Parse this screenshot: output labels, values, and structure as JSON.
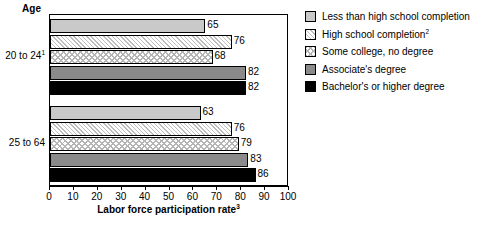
{
  "header": {
    "age_label": "Age"
  },
  "axis": {
    "x_title": "Labor force participation rate",
    "x_title_superscript": "3",
    "ticks": [
      "0",
      "10",
      "20",
      "30",
      "40",
      "50",
      "60",
      "70",
      "80",
      "90",
      "100"
    ]
  },
  "groups": [
    {
      "label": "20 to 24",
      "superscript": "1",
      "values": [
        "65",
        "76",
        "68",
        "82",
        "82"
      ]
    },
    {
      "label": "25 to 64",
      "superscript": "",
      "values": [
        "63",
        "76",
        "79",
        "83",
        "86"
      ]
    }
  ],
  "legend": {
    "items": [
      {
        "label": "Less than high school completion",
        "superscript": "",
        "swatch": "light-gray-swatch"
      },
      {
        "label": "High school completion",
        "superscript": "2",
        "swatch": "diagonal-hatch-swatch"
      },
      {
        "label": "Some college, no degree",
        "superscript": "",
        "swatch": "checker-swatch"
      },
      {
        "label": "Associate's degree",
        "superscript": "",
        "swatch": "dark-gray-swatch"
      },
      {
        "label": "Bachelor's or higher degree",
        "superscript": "",
        "swatch": "black-swatch"
      }
    ]
  },
  "chart_data": {
    "type": "bar",
    "orientation": "horizontal",
    "title": "",
    "xlabel": "Labor force participation rate",
    "ylabel": "Age",
    "xlim": [
      0,
      100
    ],
    "xticks": [
      0,
      10,
      20,
      30,
      40,
      50,
      60,
      70,
      80,
      90,
      100
    ],
    "grid": false,
    "legend_position": "right",
    "categories": [
      "20 to 24",
      "25 to 64"
    ],
    "series": [
      {
        "name": "Less than high school completion",
        "values": [
          65,
          63
        ]
      },
      {
        "name": "High school completion",
        "values": [
          76,
          76
        ]
      },
      {
        "name": "Some college, no degree",
        "values": [
          68,
          79
        ]
      },
      {
        "name": "Associate's degree",
        "values": [
          82,
          83
        ]
      },
      {
        "name": "Bachelor's or higher degree",
        "values": [
          82,
          86
        ]
      }
    ]
  }
}
